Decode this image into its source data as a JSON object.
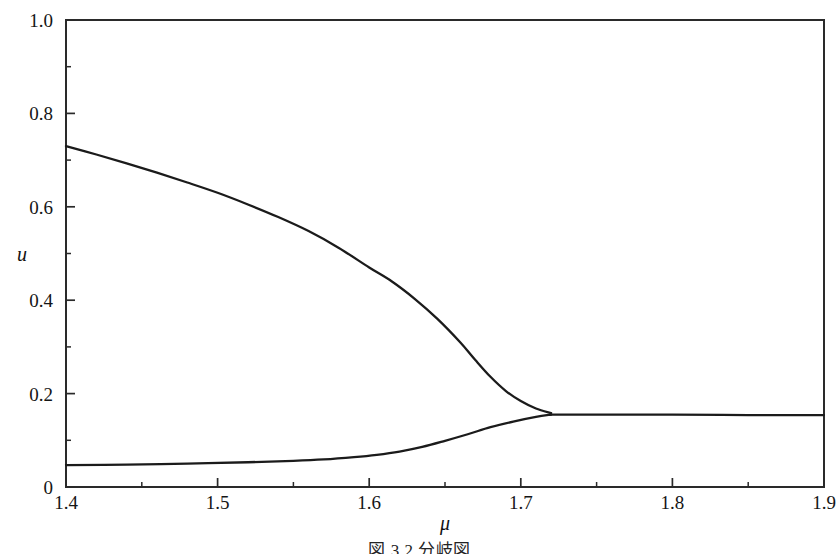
{
  "figure": {
    "caption": "図 3.2  分岐図",
    "background_color": "#ffffff",
    "ink_color": "#1b1b1b"
  },
  "chart_data": {
    "type": "line",
    "title": "",
    "subtitle": "",
    "xlabel": "μ",
    "ylabel": "u",
    "xlim": [
      1.4,
      1.9
    ],
    "ylim": [
      0.0,
      1.0
    ],
    "grid": false,
    "legend_position": "none",
    "x_major_ticks": [
      1.4,
      1.5,
      1.6,
      1.7,
      1.8,
      1.9
    ],
    "x_major_tick_labels": [
      "1.4",
      "1.5",
      "1.6",
      "1.7",
      "1.8",
      "1.9"
    ],
    "x_minor_ticks": [
      1.45,
      1.55,
      1.65,
      1.75,
      1.85
    ],
    "y_major_ticks": [
      0.0,
      0.2,
      0.4,
      0.6,
      0.8,
      1.0
    ],
    "y_major_tick_labels": [
      "0",
      "0.2",
      "0.4",
      "0.6",
      "0.8",
      "1.0"
    ],
    "y_minor_ticks": [
      0.1,
      0.3,
      0.5,
      0.7,
      0.9
    ],
    "annotations": [],
    "series": [
      {
        "name": "upper-branch",
        "color": "#1b1b1b",
        "x": [
          1.4,
          1.42,
          1.44,
          1.46,
          1.48,
          1.5,
          1.52,
          1.54,
          1.56,
          1.58,
          1.6,
          1.615,
          1.63,
          1.645,
          1.66,
          1.67,
          1.68,
          1.69,
          1.7,
          1.71,
          1.72
        ],
        "values": [
          0.73,
          0.712,
          0.693,
          0.673,
          0.652,
          0.63,
          0.605,
          0.578,
          0.548,
          0.512,
          0.47,
          0.44,
          0.403,
          0.36,
          0.31,
          0.272,
          0.236,
          0.206,
          0.184,
          0.168,
          0.158
        ]
      },
      {
        "name": "lower-branch",
        "color": "#1b1b1b",
        "x": [
          1.4,
          1.44,
          1.48,
          1.52,
          1.55,
          1.57,
          1.59,
          1.605,
          1.62,
          1.635,
          1.65,
          1.665,
          1.68,
          1.695,
          1.71,
          1.72
        ],
        "values": [
          0.047,
          0.048,
          0.05,
          0.053,
          0.056,
          0.059,
          0.064,
          0.069,
          0.076,
          0.086,
          0.099,
          0.113,
          0.128,
          0.14,
          0.15,
          0.155
        ]
      },
      {
        "name": "merged-branch",
        "color": "#1b1b1b",
        "x": [
          1.72,
          1.76,
          1.8,
          1.85,
          1.9
        ],
        "values": [
          0.155,
          0.155,
          0.155,
          0.154,
          0.154
        ]
      }
    ]
  },
  "plot_geometry": {
    "left_px": 66,
    "right_px": 824,
    "top_px": 20,
    "bottom_px": 487,
    "tick_major_len": 9,
    "tick_minor_len": 5
  },
  "labels": {
    "y_axis_title": "u",
    "x_axis_title": "μ"
  }
}
